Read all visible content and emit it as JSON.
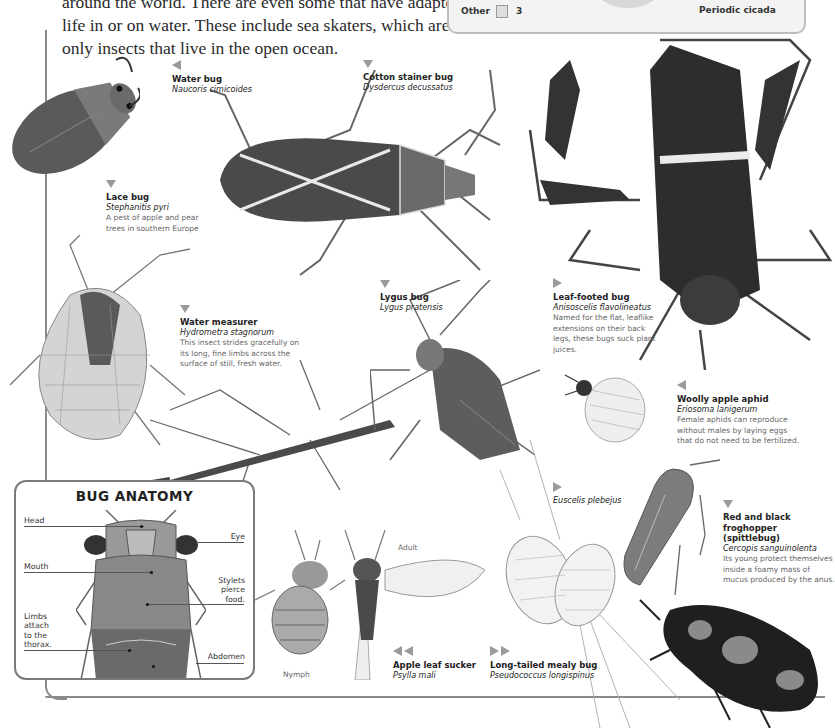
{
  "intro": {
    "text": "around the world. There are even some that have adapted to life in or on water. These include sea skaters, which are the only insects that live in the open ocean."
  },
  "infobox": {
    "other_label": "Other",
    "other_icon": "bug-icon",
    "other_count": "3",
    "image_caption": "Periodic cicada"
  },
  "species": [
    {
      "name": "Water bug",
      "scientific": "Naucoris cimicoides",
      "description": "",
      "arrow": "left"
    },
    {
      "name": "Cotton stainer bug",
      "scientific": "Dysdercus decussatus",
      "description": "",
      "arrow": "down"
    },
    {
      "name": "Lace bug",
      "scientific": "Stephanitis pyri",
      "description": "A pest of apple and pear trees in southern Europe",
      "arrow": "down"
    },
    {
      "name": "Water measurer",
      "scientific": "Hydrometra stagnorum",
      "description": "This insect strides gracefully on its long, fine limbs across the surface of still, fresh water.",
      "arrow": "down"
    },
    {
      "name": "Lygus bug",
      "scientific": "Lygus pratensis",
      "description": "",
      "arrow": "down"
    },
    {
      "name": "Leaf-footed bug",
      "scientific": "Anisoscelis flavolineatus",
      "description": "Named for the flat, leaflike extensions on their back legs, these bugs suck plant juices.",
      "arrow": "right"
    },
    {
      "name": "Woolly apple aphid",
      "scientific": "Eriosoma lanigerum",
      "description": "Female aphids can reproduce without males by laying eggs that do not need to be fertilized.",
      "arrow": "left"
    },
    {
      "name": "",
      "scientific": "Euscelis plebejus",
      "description": "",
      "arrow": "right"
    },
    {
      "name": "Red and black froghopper (spittlebug)",
      "scientific": "Cercopis sanguinolenta",
      "description": "Its young protect themselves inside a foamy mass of mucus produced by the anus.",
      "arrow": "down"
    },
    {
      "name": "Apple leaf sucker",
      "scientific": "Psylla mali",
      "description": "",
      "arrow": "double-left"
    },
    {
      "name": "Long-tailed mealy bug",
      "scientific": "Pseudococcus longispinus",
      "description": "",
      "arrow": "double-right"
    }
  ],
  "psylla_stages": {
    "adult": "Adult",
    "nymph": "Nymph"
  },
  "anatomy": {
    "title": "BUG ANATOMY",
    "parts": {
      "head": "Head",
      "eye": "Eye",
      "mouth": "Mouth",
      "stylets": "Stylets pierce food.",
      "limbs": "Limbs attach to the thorax.",
      "abdomen": "Abdomen"
    }
  },
  "colors": {
    "frame": "#8a8a8a",
    "arrow": "#9a9a9a",
    "infobox_bg": "#f3f3f3",
    "text": "#222222",
    "desc_text": "#666666"
  }
}
